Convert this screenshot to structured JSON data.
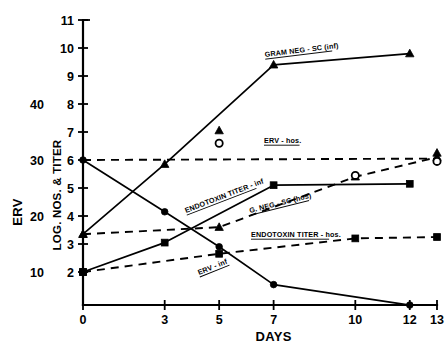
{
  "chart_data": {
    "type": "line",
    "title": "",
    "xlabel": "DAYS",
    "ylabel_primary": "LOG. NOS. & TITER",
    "ylabel_secondary": "ERV",
    "x_ticks": [
      0,
      3,
      5,
      7,
      10,
      12,
      13
    ],
    "x_tick_labels": [
      "0",
      "3",
      "5",
      "7",
      "10",
      "12",
      "13"
    ],
    "xlim": [
      0,
      13
    ],
    "y_ticks": [
      2,
      3,
      4,
      5,
      6,
      7,
      8,
      9,
      10,
      11
    ],
    "y_tick_labels": [
      "2",
      "3",
      "4",
      "5",
      "6",
      "7",
      "8",
      "9",
      "10",
      "11"
    ],
    "ylim": [
      0.55,
      11
    ],
    "y_secondary_ticks": [
      2,
      4,
      6,
      8
    ],
    "y_secondary_labels": [
      "10",
      "20",
      "30",
      "40"
    ],
    "grid": false,
    "legend_position": "inline-annotations",
    "series": [
      {
        "name": "GRAM NEG - SC (inf)",
        "label": "GRAM NEG - SC (inf)",
        "style": "solid",
        "marker": "triangle",
        "x": [
          0,
          3,
          7,
          12
        ],
        "values": [
          3.35,
          5.85,
          9.4,
          9.8
        ]
      },
      {
        "name": "ERV - inf",
        "label": "ERV - inf",
        "style": "solid",
        "marker": "circle-filled",
        "x": [
          0,
          3,
          5,
          7,
          12
        ],
        "values": [
          6.0,
          4.15,
          2.9,
          1.55,
          0.82
        ]
      },
      {
        "name": "G. NEG - SC (hos)",
        "label": "G. NEG - SC (hos)",
        "style": "solid",
        "marker": "square",
        "x": [
          0,
          3,
          7,
          12
        ],
        "values": [
          2.0,
          3.05,
          5.1,
          5.15
        ]
      },
      {
        "name": "ERV - hos.",
        "label": "ERV - hos.",
        "style": "dashed",
        "marker": "none",
        "x": [
          0,
          13
        ],
        "values": [
          6.0,
          6.05
        ]
      },
      {
        "name": "ENDOTOXIN TITER - inf",
        "label": "ENDOTOXIN TITER - inf",
        "style": "dashed",
        "marker": "triangle",
        "x": [
          0,
          5,
          10,
          13
        ],
        "values": [
          3.35,
          3.6,
          5.4,
          6.1
        ]
      },
      {
        "name": "ENDOTOXIN TITER - hos.",
        "label": "ENDOTOXIN TITER - hos.",
        "style": "dashed",
        "marker": "square",
        "x": [
          0,
          5,
          10,
          13
        ],
        "values": [
          2.0,
          2.65,
          3.2,
          3.25
        ]
      }
    ],
    "extra_markers": [
      {
        "name": "endotoxin-titer-inf-day5-triangle",
        "marker": "triangle",
        "x": 5,
        "y": 7.05
      },
      {
        "name": "erv-hos-day5-circle-open",
        "marker": "circle-open",
        "x": 5,
        "y": 6.6
      },
      {
        "name": "erv-hos-day10-circle-open",
        "marker": "circle-open",
        "x": 10,
        "y": 5.45
      },
      {
        "name": "endotoxin-titer-inf-day13-triangle",
        "marker": "triangle",
        "x": 13,
        "y": 6.25
      },
      {
        "name": "erv-hos-day13-circle-open",
        "marker": "circle-open",
        "x": 13,
        "y": 5.95
      }
    ],
    "annotations": [
      {
        "name": "gram-neg-sc-inf-label",
        "text": "GRAM NEG - SC (inf)",
        "x": 265,
        "y": 57,
        "rotate": -7
      },
      {
        "name": "erv-hos-label",
        "text": "ERV - hos.",
        "x": 264,
        "y": 143,
        "rotate": 0
      },
      {
        "name": "endotoxin-titer-inf-label",
        "text": "ENDOTOXIN TITER - inf",
        "x": 186,
        "y": 213,
        "rotate": -21
      },
      {
        "name": "g-neg-sc-hos-label",
        "text": "G. NEG - SC (hos)",
        "x": 250,
        "y": 213,
        "rotate": -14
      },
      {
        "name": "endotoxin-titer-hos-label",
        "text": "ENDOTOXIN TITER - hos.",
        "x": 251,
        "y": 237,
        "rotate": 0
      },
      {
        "name": "erv-inf-label",
        "text": "ERV - inf",
        "x": 199,
        "y": 275,
        "rotate": -22
      }
    ]
  }
}
